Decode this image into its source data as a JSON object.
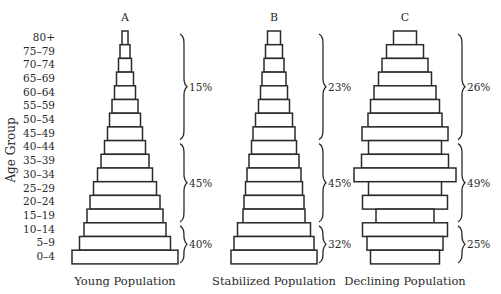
{
  "chart_data": {
    "type": "bar",
    "subtype": "population-pyramid",
    "ylabel": "Age Group",
    "categories": [
      "80+",
      "75-79",
      "70-74",
      "65-69",
      "60-64",
      "55-59",
      "50-54",
      "45-49",
      "40-44",
      "35-39",
      "30-34",
      "25-29",
      "20-24",
      "15-19",
      "10-14",
      "5-9",
      "0-4"
    ],
    "units": "relative bar width (px, read from image)",
    "panels": [
      {
        "letter": "A",
        "title": "Young Population",
        "center_x": 125,
        "values": [
          6,
          10,
          13,
          17,
          21,
          26,
          31,
          35,
          41,
          48,
          55,
          63,
          70,
          76,
          82,
          91,
          106
        ],
        "groups": [
          {
            "label": "15%",
            "from": "80+",
            "to": "45-49"
          },
          {
            "label": "45%",
            "from": "40-44",
            "to": "15-19"
          },
          {
            "label": "40%",
            "from": "10-14",
            "to": "0-4"
          }
        ]
      },
      {
        "letter": "B",
        "title": "Stabilized Population",
        "center_x": 274,
        "values": [
          13,
          17,
          20,
          24,
          27,
          31,
          37,
          42,
          45,
          50,
          54,
          57,
          60,
          62,
          73,
          80,
          86
        ],
        "groups": [
          {
            "label": "23%",
            "from": "80+",
            "to": "45-49"
          },
          {
            "label": "45%",
            "from": "40-44",
            "to": "15-19"
          },
          {
            "label": "32%",
            "from": "10-14",
            "to": "0-4"
          }
        ]
      },
      {
        "letter": "C",
        "title": "Declining Population",
        "center_x": 405,
        "values": [
          23,
          37,
          46,
          53,
          62,
          69,
          74,
          86,
          73,
          87,
          102,
          73,
          85,
          58,
          85,
          76,
          69
        ],
        "groups": [
          {
            "label": "26%",
            "from": "80+",
            "to": "45-49"
          },
          {
            "label": "49%",
            "from": "40-44",
            "to": "15-19"
          },
          {
            "label": "25%",
            "from": "10-14",
            "to": "0-4"
          }
        ]
      }
    ],
    "grid": false,
    "legend": null
  },
  "layout": {
    "row_top": 31,
    "row_height": 13.7,
    "bar_height": 13.7
  }
}
